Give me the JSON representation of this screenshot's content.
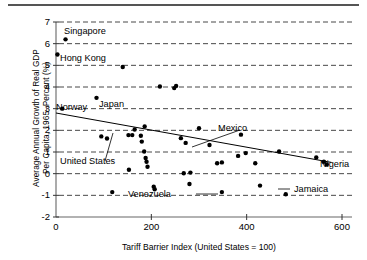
{
  "chart_data": {
    "type": "scatter",
    "title": "",
    "xlabel": "Tariff Barrier Index (United States = 100)",
    "ylabel_line1": "Average Annual Growth of Real GDP",
    "ylabel_line2": "Per Capita, 1965–Percent (%)",
    "xlim": [
      0,
      620
    ],
    "ylim": [
      -2,
      7
    ],
    "xticks": [
      0,
      200,
      400,
      600
    ],
    "xtick_labels": [
      "0",
      "200",
      "400",
      "600"
    ],
    "yticks": [
      -2,
      -1,
      0,
      1,
      2,
      3,
      4,
      5,
      6,
      7
    ],
    "ytick_labels": [
      "-2",
      "-1",
      "0",
      "1",
      "2",
      "3",
      "4",
      "5",
      "6",
      "7"
    ],
    "grid": "horizontal-dashed",
    "legend": "none",
    "marker_color": "#000000",
    "line_color": "#000000",
    "points": [
      {
        "x": 20,
        "y": 6.2,
        "label": "Singapore"
      },
      {
        "x": 3,
        "y": 5.5,
        "label": "Hong Kong"
      },
      {
        "x": 140,
        "y": 4.92,
        "label": ""
      },
      {
        "x": 218,
        "y": 4.02,
        "label": ""
      },
      {
        "x": 248,
        "y": 3.95,
        "label": ""
      },
      {
        "x": 252,
        "y": 4.05,
        "label": ""
      },
      {
        "x": 13,
        "y": 3.0,
        "label": "Norway"
      },
      {
        "x": 85,
        "y": 3.5,
        "label": "Japan"
      },
      {
        "x": 95,
        "y": 1.72,
        "label": ""
      },
      {
        "x": 107,
        "y": 1.62,
        "label": "United States"
      },
      {
        "x": 152,
        "y": 1.78,
        "label": ""
      },
      {
        "x": 160,
        "y": 1.78,
        "label": ""
      },
      {
        "x": 165,
        "y": 2.04,
        "label": ""
      },
      {
        "x": 178,
        "y": 1.75,
        "label": ""
      },
      {
        "x": 186,
        "y": 2.18,
        "label": ""
      },
      {
        "x": 180,
        "y": 1.48,
        "label": ""
      },
      {
        "x": 185,
        "y": 1.02,
        "label": ""
      },
      {
        "x": 188,
        "y": 0.72,
        "label": ""
      },
      {
        "x": 190,
        "y": 0.55,
        "label": ""
      },
      {
        "x": 192,
        "y": 0.32,
        "label": ""
      },
      {
        "x": 153,
        "y": 0.18,
        "label": ""
      },
      {
        "x": 118,
        "y": -0.85,
        "label": ""
      },
      {
        "x": 205,
        "y": -0.6,
        "label": ""
      },
      {
        "x": 207,
        "y": -0.72,
        "label": ""
      },
      {
        "x": 262,
        "y": 1.64,
        "label": ""
      },
      {
        "x": 272,
        "y": 1.42,
        "label": "Mexico"
      },
      {
        "x": 300,
        "y": 2.1,
        "label": ""
      },
      {
        "x": 322,
        "y": 1.32,
        "label": ""
      },
      {
        "x": 338,
        "y": 0.48,
        "label": ""
      },
      {
        "x": 348,
        "y": 0.52,
        "label": ""
      },
      {
        "x": 268,
        "y": 0.02,
        "label": ""
      },
      {
        "x": 282,
        "y": 0.05,
        "label": ""
      },
      {
        "x": 280,
        "y": -0.48,
        "label": ""
      },
      {
        "x": 348,
        "y": -0.85,
        "label": "Venezuela"
      },
      {
        "x": 388,
        "y": 1.8,
        "label": ""
      },
      {
        "x": 382,
        "y": 0.82,
        "label": ""
      },
      {
        "x": 398,
        "y": 0.95,
        "label": ""
      },
      {
        "x": 418,
        "y": 0.48,
        "label": ""
      },
      {
        "x": 428,
        "y": -0.55,
        "label": ""
      },
      {
        "x": 468,
        "y": 1.02,
        "label": ""
      },
      {
        "x": 482,
        "y": -0.95,
        "label": "Jamaica"
      },
      {
        "x": 546,
        "y": 0.75,
        "label": ""
      },
      {
        "x": 562,
        "y": 0.55,
        "label": "Nigeria"
      },
      {
        "x": 568,
        "y": 0.42,
        "label": ""
      }
    ],
    "trendline": {
      "x0": 0,
      "y0": 2.8,
      "x1": 578,
      "y1": 0.52,
      "style": "solid",
      "description": "negative-slope fitted regression line"
    },
    "annotations": [
      {
        "text": "Singapore",
        "name": "annotation-singapore"
      },
      {
        "text": "Hong Kong",
        "name": "annotation-hong-kong"
      },
      {
        "text": "Norway",
        "name": "annotation-norway"
      },
      {
        "text": "Japan",
        "name": "annotation-japan"
      },
      {
        "text": "Mexico",
        "name": "annotation-mexico"
      },
      {
        "text": "United States",
        "name": "annotation-united-states"
      },
      {
        "text": "Venezuela",
        "name": "annotation-venezuela"
      },
      {
        "text": "Jamaica",
        "name": "annotation-jamaica"
      },
      {
        "text": "Nigeria",
        "name": "annotation-nigeria"
      }
    ]
  },
  "labels": {
    "singapore": "Singapore",
    "hong_kong": "Hong Kong",
    "norway": "Norway",
    "japan": "Japan",
    "mexico": "Mexico",
    "united_states": "United States",
    "venezuela": "Venezuela",
    "jamaica": "Jamaica",
    "nigeria": "Nigeria"
  }
}
